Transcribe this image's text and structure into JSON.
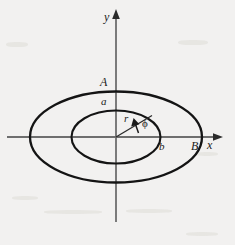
{
  "figure": {
    "background_color": "#f2f1f0",
    "ink_color": "#1a1a1a",
    "axis_color": "#6e6e6e"
  },
  "axes": {
    "x_label": "x",
    "y_label": "y",
    "origin": {
      "x": 116,
      "y": 137
    },
    "x_axis": {
      "x1": 7,
      "x2": 222,
      "y": 137,
      "arrow": "right"
    },
    "y_axis": {
      "y1": 222,
      "y2": 12,
      "x": 116,
      "arrow": "up"
    }
  },
  "curves": [
    {
      "name": "outer-ellipse",
      "semi_axis_x": 86,
      "semi_axis_y": 45.5,
      "stroke_width": 2.2,
      "label_x_intercept": "B",
      "label_y_intercept": "A"
    },
    {
      "name": "inner-ellipse",
      "semi_axis_x": 44.5,
      "semi_axis_y": 26.5,
      "stroke_width": 2.0,
      "label_x_intercept": "b",
      "label_y_intercept": "a"
    }
  ],
  "annotations": {
    "radius_label": "r",
    "angle_label": "ϕ",
    "outer_y_label": "A",
    "inner_y_label": "a",
    "inner_x_label": "b",
    "outer_x_label": "B",
    "radius_line": {
      "x1": 116,
      "y1": 137,
      "x2": 152,
      "y2": 116
    },
    "angle_arrow_tip": {
      "x": 136,
      "y": 122
    }
  },
  "label_positions": {
    "y": {
      "left": 104,
      "top": 11,
      "size": 11
    },
    "x": {
      "left": 207,
      "top": 140,
      "size": 11
    },
    "A": {
      "left": 100,
      "top": 77,
      "size": 11
    },
    "a": {
      "left": 101,
      "top": 96,
      "size": 10
    },
    "b": {
      "left": 159,
      "top": 141,
      "size": 10
    },
    "B": {
      "left": 191,
      "top": 140,
      "size": 11
    },
    "r": {
      "left": 123,
      "top": 114,
      "size": 10
    },
    "phi": {
      "left": 142,
      "top": 119,
      "size": 10
    }
  }
}
